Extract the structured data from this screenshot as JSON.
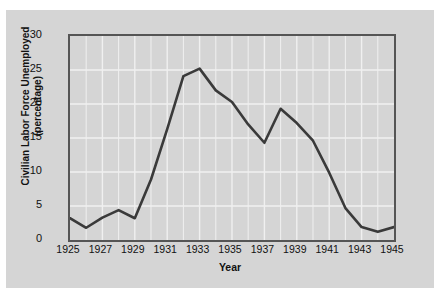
{
  "chart_data": {
    "type": "line",
    "title": "",
    "xlabel": "Year",
    "ylabel": "Civilian Labor Force Unemployed (percentage)",
    "ylabel_lines": [
      "Civilian Labor Force Unemployed",
      "(percentage)"
    ],
    "xlim": [
      1925,
      1945
    ],
    "ylim": [
      0,
      30
    ],
    "yticks": [
      0,
      5,
      10,
      15,
      20,
      25,
      30
    ],
    "ytick_labels": [
      "0",
      "5",
      "10",
      "15",
      "20",
      "25",
      "30"
    ],
    "xticks": [
      1925,
      1927,
      1929,
      1931,
      1933,
      1935,
      1937,
      1939,
      1941,
      1943,
      1945
    ],
    "xtick_labels": [
      "1925",
      "1927",
      "1929",
      "1931",
      "1933",
      "1935",
      "1937",
      "1939",
      "1941",
      "1943",
      "1945"
    ],
    "grid": true,
    "grid_color": "#f0f0f0",
    "legend": null,
    "line_color": "#3a3a3a",
    "plot_background": "#d5d5d5",
    "figure_background": "#d5d5d5",
    "x": [
      1925,
      1926,
      1927,
      1928,
      1929,
      1930,
      1931,
      1932,
      1933,
      1934,
      1935,
      1936,
      1937,
      1938,
      1939,
      1940,
      1941,
      1942,
      1943,
      1944,
      1945
    ],
    "values": [
      3.2,
      1.8,
      3.3,
      4.4,
      3.2,
      8.9,
      16.3,
      24.1,
      25.2,
      22.0,
      20.3,
      17.0,
      14.3,
      19.3,
      17.2,
      14.6,
      9.9,
      4.7,
      1.9,
      1.2,
      1.9
    ],
    "series": [
      {
        "name": "Civilian Labor Force Unemployed",
        "values": [
          3.2,
          1.8,
          3.3,
          4.4,
          3.2,
          8.9,
          16.3,
          24.1,
          25.2,
          22.0,
          20.3,
          17.0,
          14.3,
          19.3,
          17.2,
          14.6,
          9.9,
          4.7,
          1.9,
          1.2,
          1.9
        ]
      }
    ]
  }
}
